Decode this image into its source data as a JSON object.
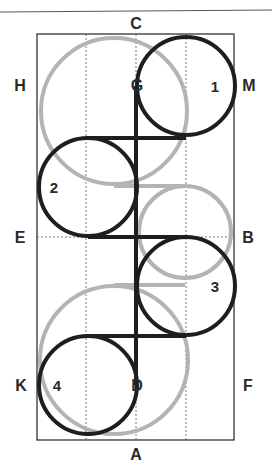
{
  "diagram": {
    "type": "figure-path-diagram",
    "colors": {
      "black_path": "#1e1e1e",
      "gray_path": "#b4b4b4",
      "frame": "#333333",
      "grid": "#555555",
      "background": "#ffffff"
    },
    "edge_labels": {
      "top": "C",
      "bottom": "A",
      "left_upper": "H",
      "left_middle": "E",
      "left_lower": "K",
      "right_upper": "M",
      "right_middle": "B",
      "right_lower": "F"
    },
    "point_labels": {
      "upper_center": "G",
      "lower_center": "D"
    },
    "circle_numbers": [
      "1",
      "2",
      "3",
      "4"
    ],
    "black_circles": [
      {
        "label": "1",
        "cx": 186,
        "cy": 86,
        "r": 49
      },
      {
        "label": "2",
        "cx": 88,
        "cy": 187,
        "r": 49
      },
      {
        "label": "3",
        "cx": 186,
        "cy": 286,
        "r": 49
      },
      {
        "label": "4",
        "cx": 88,
        "cy": 385,
        "r": 49
      }
    ],
    "gray_circles": [
      {
        "cx": 114,
        "cy": 111,
        "r": 73
      },
      {
        "cx": 185,
        "cy": 232,
        "r": 46
      },
      {
        "cx": 114,
        "cy": 360,
        "r": 74
      }
    ],
    "frame": {
      "x": 37,
      "y": 34,
      "width": 197,
      "height": 406
    },
    "center_mark": "star"
  }
}
